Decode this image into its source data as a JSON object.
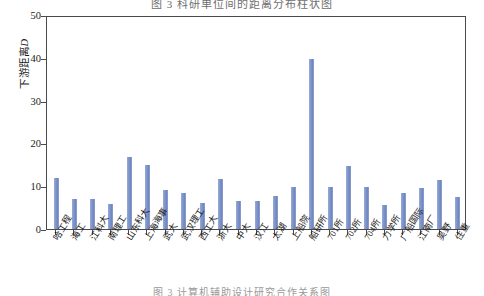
{
  "figure": {
    "top_title": "图 3   科研单位间的距离分布柱状图",
    "bottom_caption": "图 3   计算机辅助设计研究合作关系图"
  },
  "chart_data": {
    "type": "bar",
    "title": "图 3   科研单位间的距离分布柱状图",
    "xlabel": "",
    "ylabel": "下游距离D",
    "ylim": [
      0,
      50
    ],
    "yticks": [
      0,
      10,
      20,
      30,
      40,
      50
    ],
    "grid": false,
    "legend": "none",
    "bar_color": "#7b93c8",
    "categories": [
      "哈工程",
      "海工",
      "江科大",
      "南理工",
      "山东科大",
      "上海海事",
      "武大",
      "武汉理工",
      "西工大",
      "浙大",
      "中大",
      "汉江",
      "太湖",
      "上船院",
      "船研所",
      "701所",
      "702所",
      "704所",
      "力学所",
      "广船国际",
      "江南厂",
      "吴野",
      "住重"
    ],
    "values": [
      12.0,
      7.0,
      7.0,
      6.0,
      17.0,
      15.0,
      9.2,
      8.6,
      6.2,
      11.8,
      6.6,
      6.5,
      7.8,
      9.8,
      40.0,
      9.8,
      14.8,
      9.8,
      5.7,
      8.5,
      9.7,
      11.5,
      7.6
    ]
  }
}
